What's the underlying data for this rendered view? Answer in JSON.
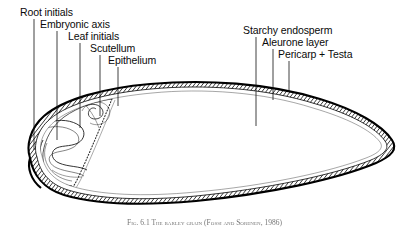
{
  "figure": {
    "caption": "Fig. 6.1  The barley grain (Fossi and Sorenen, 1986)",
    "caption_prefix": "Fig. 6.1",
    "caption_body": "The barley grain (Fossi and Sorenen, 1986)"
  },
  "colors": {
    "ink": "#0a0a0a",
    "outline": "#000000",
    "hatch": "#1a1a1a",
    "endosperm_fill": "#ffffff",
    "caption": "#5d5d5d"
  },
  "labels_left": [
    {
      "id": "root-initials",
      "text": "Root initials",
      "text_x": 20,
      "text_y": 7,
      "leader_x": 34,
      "leader_y1": 19,
      "leader_y2": 150
    },
    {
      "id": "embryonic-axis",
      "text": "Embryonic axis",
      "text_x": 40,
      "text_y": 19,
      "leader_x": 57,
      "leader_y1": 31,
      "leader_y2": 140
    },
    {
      "id": "leaf-initials",
      "text": "Leaf initials",
      "text_x": 68,
      "text_y": 31,
      "leader_x": 80,
      "leader_y1": 43,
      "leader_y2": 128
    },
    {
      "id": "scutellum",
      "text": "Scutellum",
      "text_x": 90,
      "text_y": 43,
      "leader_x": 100,
      "leader_y1": 55,
      "leader_y2": 116
    },
    {
      "id": "epithelium",
      "text": "Epithelium",
      "text_x": 108,
      "text_y": 55,
      "leader_x": 118,
      "leader_y1": 67,
      "leader_y2": 106
    }
  ],
  "labels_right": [
    {
      "id": "starchy-endosperm",
      "text": "Starchy endosperm",
      "text_x": 243,
      "text_y": 25,
      "leader_x": 256,
      "leader_y1": 37,
      "leader_y2": 126
    },
    {
      "id": "aleurone-layer",
      "text": "Aleurone layer",
      "text_x": 262,
      "text_y": 37,
      "leader_x": 273,
      "leader_y1": 49,
      "leader_y2": 100
    },
    {
      "id": "pericarp-testa",
      "text": "Pericarp + Testa",
      "text_x": 278,
      "text_y": 49,
      "leader_x": 289,
      "leader_y1": 61,
      "leader_y2": 92
    }
  ]
}
